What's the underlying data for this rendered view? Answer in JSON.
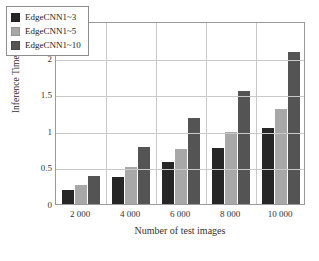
{
  "scan_artifact_text": "",
  "chart_data": {
    "type": "bar",
    "title": "",
    "xlabel": "Number of test images",
    "ylabel": "Inference Time/s",
    "categories": [
      "2 000",
      "4 000",
      "6 000",
      "8 000",
      "10 000"
    ],
    "series": [
      {
        "name": "EdgeCNN1~3",
        "color": "#262626",
        "values": [
          0.19,
          0.37,
          0.58,
          0.76,
          1.04
        ]
      },
      {
        "name": "EdgeCNN1~5",
        "color": "#a8a8a8",
        "values": [
          0.26,
          0.5,
          0.75,
          0.98,
          1.3
        ]
      },
      {
        "name": "EdgeCNN1~10",
        "color": "#545454",
        "values": [
          0.38,
          0.78,
          1.18,
          1.55,
          2.08
        ]
      }
    ],
    "ylim": [
      0,
      2.5
    ],
    "yticks": [
      "0",
      "0.5",
      "1",
      "1.5",
      "2",
      "2.5"
    ],
    "ytick_values": [
      0,
      0.5,
      1,
      1.5,
      2,
      2.5
    ],
    "grid": true,
    "legend_position": "upper-left"
  }
}
